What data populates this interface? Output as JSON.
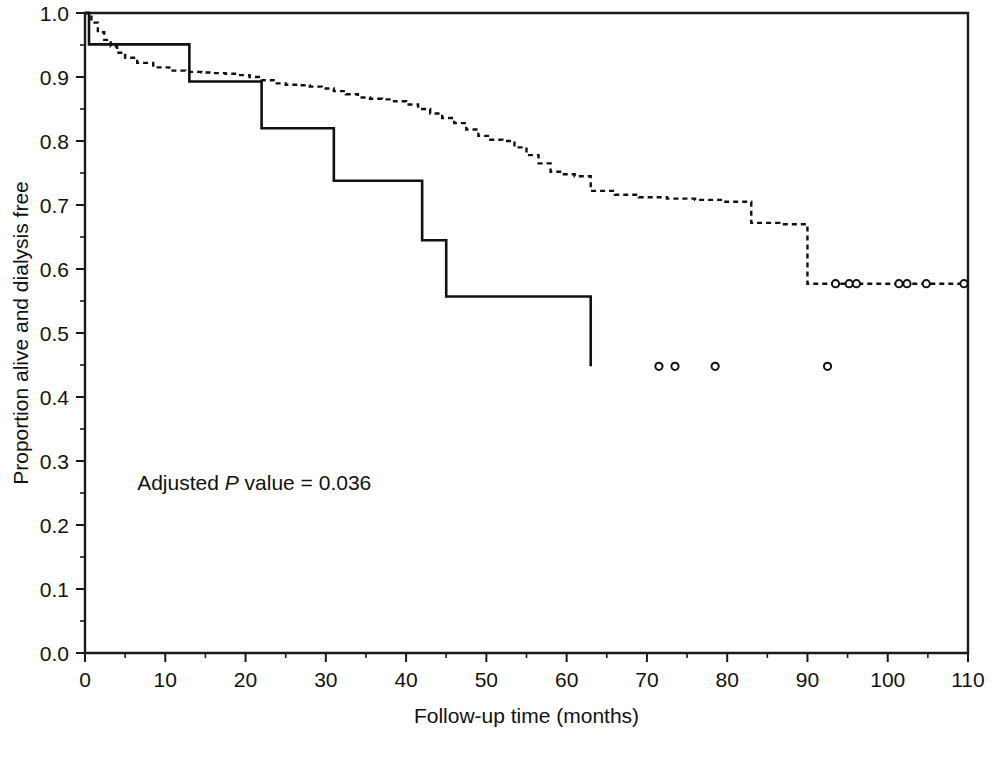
{
  "figure": {
    "background_color": "#ffffff",
    "line_color": "#111111"
  },
  "annotation": {
    "prefix": "Adjusted ",
    "italic": "P",
    "suffix": " value = 0.036",
    "full_text": "Adjusted P value = 0.036",
    "x_month": 6.5,
    "y_proportion": 0.255
  },
  "chart_data": {
    "type": "line",
    "title": "",
    "xlabel": "Follow-up time (months)",
    "ylabel": "Proportion alive and dialysis free",
    "xlim": [
      0,
      110
    ],
    "ylim": [
      0.0,
      1.0
    ],
    "grid": false,
    "legend": "none",
    "xticks": [
      0,
      10,
      20,
      30,
      40,
      50,
      60,
      70,
      80,
      90,
      100,
      110
    ],
    "xticklabels": [
      "0",
      "10",
      "20",
      "30",
      "40",
      "50",
      "60",
      "70",
      "80",
      "90",
      "100",
      "110"
    ],
    "xminor_ticks": [
      5,
      15,
      25,
      35,
      45,
      55,
      65,
      75,
      85,
      95,
      105
    ],
    "yticks": [
      0.0,
      0.1,
      0.2,
      0.3,
      0.4,
      0.5,
      0.6,
      0.7,
      0.8,
      0.9,
      1.0
    ],
    "yticklabels": [
      "0.0",
      "0.1",
      "0.2",
      "0.3",
      "0.4",
      "0.5",
      "0.6",
      "0.7",
      "0.8",
      "0.9",
      "1.0"
    ],
    "yminor_ticks": [
      0.05,
      0.15,
      0.25,
      0.35,
      0.45,
      0.55,
      0.65,
      0.75,
      0.85,
      0.95
    ],
    "series": [
      {
        "name": "solid-curve",
        "style": "solid",
        "step": "post",
        "x": [
          0,
          0.5,
          13,
          13,
          22,
          22,
          31,
          31,
          42,
          42,
          45,
          45,
          63,
          63
        ],
        "y": [
          1.0,
          0.951,
          0.951,
          0.893,
          0.893,
          0.82,
          0.82,
          0.738,
          0.738,
          0.645,
          0.645,
          0.557,
          0.557,
          0.448
        ],
        "censor_x": [
          71.5,
          73.5,
          78.5,
          92.5
        ],
        "censor_y": [
          0.448,
          0.448,
          0.448,
          0.448
        ]
      },
      {
        "name": "dashed-curve",
        "style": "dashed",
        "step": "post",
        "x": [
          0,
          0.8,
          1.6,
          2.4,
          3.2,
          4.0,
          5.0,
          6.5,
          8.5,
          10.5,
          12.5,
          14.5,
          16.0,
          17.5,
          19.0,
          20.5,
          22.0,
          23.5,
          25.0,
          26.5,
          28.0,
          29.5,
          31.0,
          32.5,
          34.0,
          35.5,
          37.0,
          38.5,
          40.0,
          41.5,
          43.0,
          44.5,
          46.0,
          47.5,
          49.0,
          50.5,
          52.0,
          53.5,
          55.0,
          56.5,
          58.0,
          59.5,
          61.0,
          63.0,
          66.0,
          69.0,
          72.5,
          76.0,
          79.5,
          83.0,
          86.5,
          90.0,
          90.0,
          110.0
        ],
        "y": [
          1.0,
          0.985,
          0.97,
          0.958,
          0.948,
          0.938,
          0.93,
          0.922,
          0.915,
          0.91,
          0.908,
          0.907,
          0.906,
          0.905,
          0.903,
          0.9,
          0.895,
          0.89,
          0.888,
          0.887,
          0.885,
          0.882,
          0.878,
          0.873,
          0.868,
          0.866,
          0.865,
          0.862,
          0.857,
          0.85,
          0.843,
          0.836,
          0.828,
          0.818,
          0.808,
          0.802,
          0.8,
          0.79,
          0.778,
          0.765,
          0.752,
          0.748,
          0.745,
          0.722,
          0.716,
          0.712,
          0.71,
          0.708,
          0.705,
          0.672,
          0.67,
          0.67,
          0.577,
          0.577
        ],
        "censor_x": [
          93.5,
          95.2,
          96.1,
          101.4,
          102.4,
          104.8,
          109.5
        ],
        "censor_y": [
          0.577,
          0.577,
          0.577,
          0.577,
          0.577,
          0.577,
          0.577
        ]
      }
    ]
  }
}
